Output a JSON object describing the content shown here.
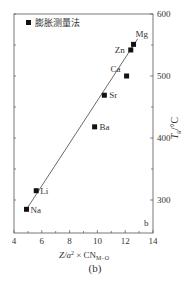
{
  "chart_data": {
    "type": "scatter",
    "title": "",
    "legend": [
      {
        "label": "膨胀测量法",
        "marker": "square"
      }
    ],
    "legend_position": "top-left",
    "xlabel": "Z/a² × CN_M-O",
    "ylabel": "Tg/°C",
    "ylabel_position": "right",
    "xlim": [
      4,
      14
    ],
    "ylim": [
      250,
      600
    ],
    "xticks": [
      4,
      6,
      8,
      10,
      12,
      14
    ],
    "yticks": [
      300,
      400,
      500,
      600
    ],
    "grid": false,
    "points": [
      {
        "label": "Na",
        "x": 4.9,
        "y": 285
      },
      {
        "label": "Li",
        "x": 5.6,
        "y": 315
      },
      {
        "label": "Ba",
        "x": 9.8,
        "y": 418
      },
      {
        "label": "Sr",
        "x": 10.5,
        "y": 469
      },
      {
        "label": "Ca",
        "x": 12.1,
        "y": 500
      },
      {
        "label": "Zn",
        "x": 12.4,
        "y": 542
      },
      {
        "label": "Mg",
        "x": 12.6,
        "y": 551
      }
    ],
    "fit_line": {
      "x0": 4.9,
      "y0": 285,
      "x1": 12.9,
      "y1": 560
    },
    "panel_label": "b",
    "caption": "(b)"
  },
  "labels": {
    "legend": "膨胀测量法",
    "xlabel_main": "Z/a",
    "xlabel_sup": "2",
    "xlabel_times": " × CN",
    "xlabel_sub": "M−O",
    "ylabel_main": "T",
    "ylabel_sub": "g",
    "ylabel_unit": "/°C",
    "panel": "b",
    "caption": "(b)"
  }
}
